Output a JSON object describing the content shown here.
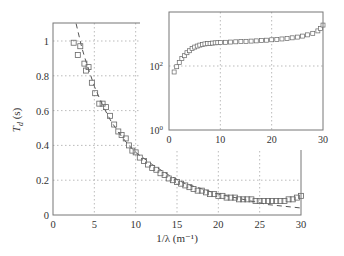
{
  "chart_data": [
    {
      "id": "main",
      "type": "scatter",
      "title": "",
      "xlabel": "1/λ (m⁻¹)",
      "ylabel": "T_d (s)",
      "xlim": [
        0,
        30
      ],
      "ylim": [
        0,
        1.1
      ],
      "xticks": [
        0,
        5,
        10,
        15,
        20,
        25,
        30
      ],
      "yticks": [
        0,
        0.2,
        0.4,
        0.6,
        0.8,
        1
      ],
      "ytick_labels": [
        "0",
        "0.2",
        "0.4",
        "0.6",
        "0.8",
        "1"
      ],
      "grid": true,
      "legend": null,
      "series": [
        {
          "name": "measured",
          "style": "open-square-markers",
          "x": [
            2.5,
            3.0,
            3.3,
            3.8,
            4.0,
            4.3,
            4.7,
            5.1,
            5.6,
            6.0,
            6.4,
            6.9,
            7.4,
            7.9,
            8.3,
            8.8,
            9.2,
            9.6,
            10.0,
            10.5,
            11.0,
            11.5,
            12.0,
            12.5,
            13.0,
            13.5,
            14.0,
            14.5,
            15.0,
            15.5,
            16.0,
            16.5,
            17.0,
            17.5,
            18.0,
            18.5,
            19.0,
            19.5,
            20.0,
            20.5,
            21.0,
            21.5,
            22.0,
            22.5,
            23.0,
            23.5,
            24.0,
            24.5,
            25.0,
            25.5,
            26.0,
            26.5,
            27.0,
            27.5,
            28.0,
            28.5,
            29.0,
            29.5,
            30.0
          ],
          "y": [
            0.99,
            0.92,
            0.97,
            0.87,
            0.83,
            0.85,
            0.76,
            0.7,
            0.64,
            0.64,
            0.62,
            0.57,
            0.52,
            0.48,
            0.46,
            0.44,
            0.4,
            0.37,
            0.36,
            0.33,
            0.31,
            0.29,
            0.27,
            0.26,
            0.24,
            0.23,
            0.21,
            0.2,
            0.19,
            0.18,
            0.17,
            0.16,
            0.15,
            0.14,
            0.14,
            0.13,
            0.12,
            0.12,
            0.11,
            0.11,
            0.1,
            0.1,
            0.1,
            0.09,
            0.09,
            0.09,
            0.09,
            0.08,
            0.08,
            0.08,
            0.08,
            0.08,
            0.08,
            0.08,
            0.08,
            0.09,
            0.09,
            0.1,
            0.11
          ]
        },
        {
          "name": "fit",
          "style": "dashed-line",
          "x": [
            2.8,
            3.5,
            4,
            5,
            6,
            7,
            8,
            9,
            10,
            12,
            14,
            16,
            18,
            20,
            22,
            24,
            26,
            28,
            30
          ],
          "y": [
            1.1,
            0.96,
            0.88,
            0.74,
            0.63,
            0.54,
            0.47,
            0.41,
            0.36,
            0.29,
            0.23,
            0.18,
            0.15,
            0.12,
            0.1,
            0.08,
            0.06,
            0.05,
            0.04
          ]
        }
      ]
    },
    {
      "id": "inset",
      "type": "scatter",
      "title": "",
      "xlabel": "",
      "ylabel": "",
      "xlim": [
        0,
        30
      ],
      "ylim_log10": [
        0,
        3.7
      ],
      "yscale": "log",
      "xticks": [
        0,
        10,
        20,
        30
      ],
      "ytick_labels": [
        "10^0",
        "10^2"
      ],
      "yticks_log10": [
        0,
        2
      ],
      "grid": true,
      "series": [
        {
          "name": "measured",
          "style": "open-square-markers",
          "x": [
            1,
            1.5,
            2,
            2.5,
            3,
            3.5,
            4,
            4.5,
            5,
            5.5,
            6,
            6.5,
            7,
            7.5,
            8,
            8.5,
            9,
            9.5,
            10,
            11,
            12,
            13,
            14,
            15,
            16,
            17,
            18,
            19,
            20,
            21,
            22,
            23,
            24,
            25,
            26,
            27,
            28,
            29,
            29.5,
            30
          ],
          "y": [
            65,
            95,
            130,
            170,
            210,
            260,
            300,
            350,
            390,
            420,
            450,
            470,
            490,
            500,
            510,
            520,
            530,
            535,
            540,
            550,
            560,
            570,
            580,
            590,
            600,
            610,
            620,
            640,
            660,
            680,
            700,
            730,
            760,
            800,
            860,
            940,
            1050,
            1250,
            1500,
            1900
          ]
        }
      ]
    }
  ],
  "labels": {
    "main_xlabel": "1/λ (m⁻¹)",
    "main_ylabel_base": "T",
    "main_ylabel_sub": "d",
    "main_ylabel_unit": " (s)",
    "main_xticks": [
      "0",
      "5",
      "10",
      "15",
      "20",
      "25",
      "30"
    ],
    "main_yticks": [
      "0",
      "0.2",
      "0.4",
      "0.6",
      "0.8",
      "1"
    ],
    "inset_xticks": [
      "0",
      "10",
      "20",
      "30"
    ],
    "inset_ytick_base": "10",
    "inset_yticks_exp": [
      "0",
      "2"
    ]
  },
  "colors": {
    "axis": "#777777",
    "grid": "#aaaaaa",
    "marker": "#666666",
    "fit": "#555555",
    "text": "#333333"
  }
}
